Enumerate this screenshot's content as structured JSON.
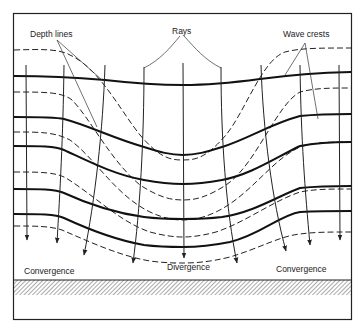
{
  "diagram": {
    "labels": {
      "rays": "Rays",
      "depth_lines": "Depth lines",
      "wave_crests": "Wave crests",
      "convergence_left": "Convergence",
      "divergence": "Divergence",
      "convergence_right": "Convergence"
    },
    "legend": {
      "solid_line": "wave crest",
      "dashed_line": "depth line (contour)",
      "arrow_line": "ray (wave orthogonal)",
      "hatched_band": "shoreline"
    },
    "colors": {
      "ink": "#222222",
      "background": "#ffffff"
    },
    "counts": {
      "rays": 9,
      "wave_crests": 5,
      "depth_lines": 5
    }
  }
}
